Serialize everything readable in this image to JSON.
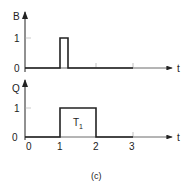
{
  "figure": {
    "caption": "(c)",
    "plots": [
      {
        "name": "B",
        "ylabel": "B",
        "xlabel": "t",
        "yticks": [
          "0",
          "1"
        ],
        "signal": "pulse",
        "pulse": {
          "start": 1.0,
          "end": 1.2,
          "high": 1
        }
      },
      {
        "name": "Q",
        "ylabel": "Q",
        "xlabel": "t",
        "yticks": [
          "0",
          "1"
        ],
        "xticks": [
          "0",
          "1",
          "2",
          "3"
        ],
        "signal": "pulse",
        "pulse": {
          "start": 1,
          "end": 2,
          "high": 1
        },
        "annotation": {
          "text": "T",
          "sub": "1"
        }
      }
    ]
  }
}
